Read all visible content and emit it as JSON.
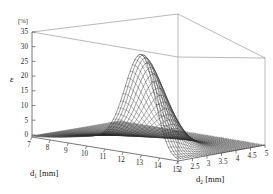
{
  "figure": {
    "kind": "3d-surface-mesh-plot",
    "background_color": "#ffffff",
    "line_color": "#333333",
    "frame_color": "#777777"
  },
  "axes": {
    "z": {
      "label": "ε",
      "unit": "[%]",
      "ticks": [
        "35",
        "30",
        "25",
        "20",
        "15",
        "10",
        "5",
        "0"
      ],
      "range": [
        0,
        35
      ],
      "step": 5
    },
    "x": {
      "label": "d",
      "label_sub": "1",
      "unit": "[mm]",
      "title": "d₁ [mm]",
      "ticks": [
        "7",
        "8",
        "9",
        "10",
        "11",
        "12",
        "13",
        "14",
        "15"
      ],
      "range": [
        7,
        15
      ],
      "step": 1
    },
    "y": {
      "label": "d",
      "label_sub": "2",
      "unit": "[mm]",
      "title": "d₂ [mm]",
      "ticks": [
        "2",
        "2.5",
        "3",
        "3.5",
        "4",
        "4.5",
        "5"
      ],
      "range": [
        2,
        5
      ],
      "step": 0.5
    }
  },
  "chart_data": {
    "type": "line",
    "title": "",
    "xlabel": "d₁ [mm]",
    "ylabel": "d₂ [mm]",
    "zlabel": "ε [%]",
    "xlim": [
      7,
      15
    ],
    "ylim": [
      2,
      5
    ],
    "zlim": [
      0,
      35
    ],
    "grid": true,
    "legend": "none",
    "x": [
      7,
      8,
      9,
      10,
      11,
      12,
      13,
      14,
      15
    ],
    "y": [
      2,
      2.5,
      3,
      3.5,
      4,
      4.5,
      5
    ],
    "series": [
      {
        "name": "d2 = 2.00",
        "values": [
          0.4,
          0.9,
          1.8,
          3.6,
          8.2,
          19.0,
          30.0,
          17.0,
          5.0
        ]
      },
      {
        "name": "d2 = 2.25",
        "values": [
          0.4,
          0.8,
          1.6,
          3.2,
          7.3,
          17.2,
          28.5,
          15.0,
          4.2
        ]
      },
      {
        "name": "d2 = 2.50",
        "values": [
          0.3,
          0.7,
          1.4,
          2.8,
          6.4,
          15.0,
          26.0,
          12.5,
          3.4
        ]
      },
      {
        "name": "d2 = 2.75",
        "values": [
          0.3,
          0.6,
          1.2,
          2.4,
          5.4,
          12.4,
          22.0,
          10.0,
          2.7
        ]
      },
      {
        "name": "d2 = 3.00",
        "values": [
          0.2,
          0.5,
          1.0,
          1.9,
          4.3,
          9.6,
          17.0,
          7.4,
          2.0
        ]
      },
      {
        "name": "d2 = 3.25",
        "values": [
          0.2,
          0.4,
          0.8,
          1.5,
          3.2,
          6.8,
          11.5,
          5.0,
          1.4
        ]
      },
      {
        "name": "d2 = 3.50",
        "values": [
          0.2,
          0.3,
          0.6,
          1.1,
          2.2,
          4.4,
          7.0,
          3.1,
          0.9
        ]
      },
      {
        "name": "d2 = 3.75",
        "values": [
          0.1,
          0.2,
          0.4,
          0.8,
          1.5,
          2.7,
          4.0,
          1.9,
          0.6
        ]
      },
      {
        "name": "d2 = 4.00",
        "values": [
          0.1,
          0.2,
          0.3,
          0.5,
          0.9,
          1.6,
          2.2,
          1.1,
          0.4
        ]
      },
      {
        "name": "d2 = 4.25",
        "values": [
          0.1,
          0.1,
          0.2,
          0.3,
          0.6,
          0.9,
          1.2,
          0.7,
          0.2
        ]
      },
      {
        "name": "d2 = 4.50",
        "values": [
          0.1,
          0.1,
          0.1,
          0.2,
          0.3,
          0.5,
          0.7,
          0.4,
          0.2
        ]
      },
      {
        "name": "d2 = 4.75",
        "values": [
          0.0,
          0.1,
          0.1,
          0.1,
          0.2,
          0.3,
          0.4,
          0.2,
          0.1
        ]
      },
      {
        "name": "d2 = 5.00",
        "values": [
          0.0,
          0.0,
          0.1,
          0.1,
          0.1,
          0.2,
          0.2,
          0.1,
          0.1
        ]
      }
    ],
    "peak": {
      "z": 30.0,
      "d1": 13.0,
      "d2": 2.0
    }
  }
}
